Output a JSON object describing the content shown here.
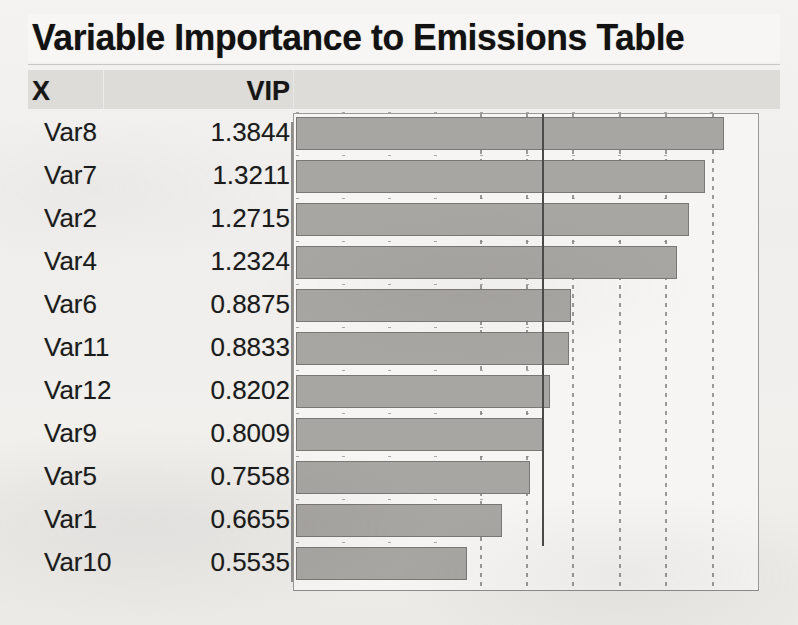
{
  "title": "Variable Importance to Emissions Table",
  "columns": {
    "x": "X",
    "vip": "VIP"
  },
  "rows": [
    {
      "x": "Var8",
      "vip": "1.3844"
    },
    {
      "x": "Var7",
      "vip": "1.3211"
    },
    {
      "x": "Var2",
      "vip": "1.2715"
    },
    {
      "x": "Var4",
      "vip": "1.2324"
    },
    {
      "x": "Var6",
      "vip": "0.8875"
    },
    {
      "x": "Var11",
      "vip": "0.8833"
    },
    {
      "x": "Var12",
      "vip": "0.8202"
    },
    {
      "x": "Var9",
      "vip": "0.8009"
    },
    {
      "x": "Var5",
      "vip": "0.7558"
    },
    {
      "x": "Var1",
      "vip": "0.6655"
    },
    {
      "x": "Var10",
      "vip": "0.5535"
    }
  ],
  "colors": {
    "bar_fill": "#a8a6a3",
    "bar_border": "#7a7875",
    "header_band": "#dedcd9",
    "chart_background": "#f6f5f3",
    "gridline": "#8b8986",
    "reference_line": "#4d4b49",
    "text": "#1b1b1b"
  },
  "chart_data": {
    "type": "bar",
    "orientation": "horizontal",
    "title": "Variable Importance to Emissions Table",
    "xlabel": "VIP",
    "ylabel": "X",
    "categories": [
      "Var8",
      "Var7",
      "Var2",
      "Var4",
      "Var6",
      "Var11",
      "Var12",
      "Var9",
      "Var5",
      "Var1",
      "Var10"
    ],
    "values": [
      1.3844,
      1.3211,
      1.2715,
      1.2324,
      0.8875,
      0.8833,
      0.8202,
      0.8009,
      0.7558,
      0.6655,
      0.5535
    ],
    "xlim": [
      0,
      1.5
    ],
    "gridlines": [
      0.6,
      0.75,
      0.9,
      1.05,
      1.2,
      1.35
    ],
    "reference_line": 0.8,
    "grid": true,
    "legend": false,
    "tick_labels": []
  }
}
